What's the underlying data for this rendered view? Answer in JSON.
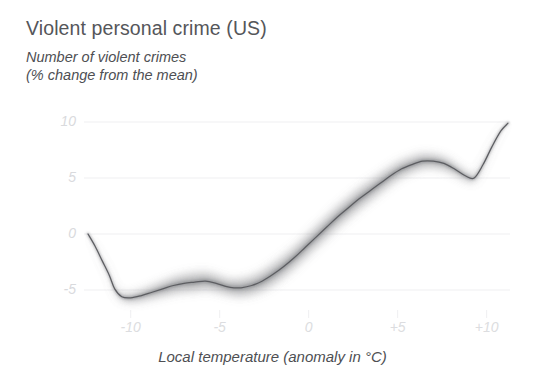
{
  "title": "Violent personal crime (US)",
  "subtitle": "Number of violent crimes\n(% change from the mean)",
  "xaxis_title": "Local temperature (anomaly in °C)",
  "colors": {
    "title": "#55565a",
    "subtitle": "#4e4f53",
    "tick": "#dcdde0",
    "gridline": "#efeff1",
    "line": "#5d5e62",
    "band": "#8e8f93",
    "background": "#ffffff"
  },
  "chart_data": {
    "type": "line",
    "title": "Violent personal crime (US)",
    "subtitle": "Number of violent crimes (% change from the mean)",
    "xlabel": "Local temperature (anomaly in °C)",
    "ylabel": "Number of violent crimes (% change from the mean)",
    "xlim": [
      -12.4,
      -12.4
    ],
    "ylim": [
      -7.0,
      10.6
    ],
    "grid": true,
    "legend": null,
    "yticks": [
      -5,
      0,
      5,
      10
    ],
    "ytick_labels": [
      "-5",
      "0",
      "5",
      "10"
    ],
    "xticks": [
      -10,
      -5,
      0,
      5,
      10
    ],
    "xtick_labels": [
      "-10",
      "-5",
      "0",
      "+5",
      "+10"
    ],
    "series": [
      {
        "name": "Violent crime change vs local temperature anomaly",
        "uncertainty_band": true,
        "x": [
          -12.4,
          -12.0,
          -11.6,
          -11.2,
          -10.9,
          -10.5,
          -10.0,
          -9.4,
          -8.8,
          -8.2,
          -7.6,
          -7.0,
          -6.4,
          -5.8,
          -5.2,
          -4.6,
          -4.2,
          -3.8,
          -3.2,
          -2.6,
          -2.0,
          -1.4,
          -0.8,
          -0.2,
          0.4,
          1.0,
          1.6,
          2.2,
          2.8,
          3.4,
          4.0,
          4.6,
          5.2,
          5.8,
          6.4,
          7.0,
          7.6,
          8.2,
          8.8,
          9.3,
          9.8,
          10.3,
          10.8,
          11.2
        ],
        "y": [
          0.0,
          -1.1,
          -2.4,
          -3.7,
          -4.9,
          -5.6,
          -5.7,
          -5.5,
          -5.2,
          -4.9,
          -4.6,
          -4.4,
          -4.3,
          -4.2,
          -4.4,
          -4.7,
          -4.8,
          -4.8,
          -4.6,
          -4.2,
          -3.6,
          -2.9,
          -2.1,
          -1.2,
          -0.3,
          0.6,
          1.5,
          2.3,
          3.1,
          3.8,
          4.5,
          5.2,
          5.8,
          6.2,
          6.5,
          6.5,
          6.3,
          5.8,
          5.2,
          5.0,
          6.2,
          7.8,
          9.2,
          9.9
        ],
        "band_half_width": [
          0.0,
          0.05,
          0.1,
          0.15,
          0.2,
          0.3,
          0.4,
          0.5,
          0.6,
          0.7,
          0.8,
          0.85,
          0.9,
          0.85,
          0.8,
          0.75,
          0.8,
          0.85,
          0.9,
          0.95,
          1.0,
          1.0,
          1.0,
          1.0,
          1.0,
          1.0,
          1.0,
          1.0,
          1.0,
          0.95,
          0.9,
          0.85,
          0.8,
          0.75,
          0.7,
          0.65,
          0.6,
          0.5,
          0.4,
          0.3,
          0.2,
          0.12,
          0.06,
          0.0
        ]
      }
    ]
  }
}
